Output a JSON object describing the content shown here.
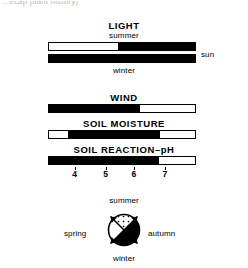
{
  "page": {
    "top_fragment": "...ecap plant history)",
    "background_color": "#ffffff",
    "ink_color": "#000000"
  },
  "light": {
    "heading": "LIGHT",
    "top_caption": "summer",
    "bottom_caption": "winter",
    "left_label": "shade",
    "right_label": "sun",
    "bars": [
      {
        "name": "summer",
        "black_start_pct": 0,
        "black_fill_pct": 0,
        "white_pct": 47,
        "segments": [
          {
            "color": "#ffffff",
            "start_pct": 0,
            "end_pct": 47
          },
          {
            "color": "#000000",
            "start_pct": 47,
            "end_pct": 100
          }
        ]
      },
      {
        "name": "winter",
        "segments": [
          {
            "color": "#000000",
            "start_pct": 0,
            "end_pct": 100
          }
        ]
      }
    ]
  },
  "wind": {
    "heading": "WIND",
    "left_label": "low",
    "right_label": "high",
    "segments": [
      {
        "color": "#000000",
        "start_pct": 0,
        "end_pct": 62
      },
      {
        "color": "#ffffff",
        "start_pct": 62,
        "end_pct": 100
      }
    ]
  },
  "soil_moisture": {
    "heading": "SOIL MOISTURE",
    "left_label": "wet",
    "right_label": "dry",
    "segments": [
      {
        "color": "#ffffff",
        "start_pct": 0,
        "end_pct": 13
      },
      {
        "color": "#000000",
        "start_pct": 13,
        "end_pct": 76
      },
      {
        "color": "#ffffff",
        "start_pct": 76,
        "end_pct": 100
      }
    ]
  },
  "soil_reaction": {
    "heading": "SOIL REACTION–pH",
    "left_label": "acidic",
    "right_label": "neutral",
    "segments": [
      {
        "color": "#000000",
        "start_pct": 0,
        "end_pct": 75
      },
      {
        "color": "#ffffff",
        "start_pct": 75,
        "end_pct": 100
      }
    ],
    "axis": {
      "ticks": [
        {
          "label": "4",
          "pos_pct": 18
        },
        {
          "label": "5",
          "pos_pct": 39
        },
        {
          "label": "6",
          "pos_pct": 58
        },
        {
          "label": "7",
          "pos_pct": 79
        }
      ]
    }
  },
  "season_circle": {
    "labels": {
      "top": "summer",
      "right": "autumn",
      "bottom": "winter",
      "left": "spring"
    },
    "quadrants": [
      {
        "name": "summer",
        "position": "top",
        "fill": "stipple"
      },
      {
        "name": "autumn",
        "position": "right",
        "fill": "#000000"
      },
      {
        "name": "winter",
        "position": "bottom",
        "fill": "#000000"
      },
      {
        "name": "spring",
        "position": "left",
        "fill": "#ffffff"
      }
    ]
  },
  "chart_data": {
    "type": "bar",
    "series": [
      {
        "name": "LIGHT (summer)",
        "left_end": "shade",
        "right_end": "sun",
        "filled_from_pct": 47,
        "filled_to_pct": 100
      },
      {
        "name": "LIGHT (winter)",
        "left_end": "shade",
        "right_end": "sun",
        "filled_from_pct": 0,
        "filled_to_pct": 100
      },
      {
        "name": "WIND",
        "left_end": "low",
        "right_end": "high",
        "filled_from_pct": 0,
        "filled_to_pct": 62
      },
      {
        "name": "SOIL MOISTURE",
        "left_end": "wet",
        "right_end": "dry",
        "filled_from_pct": 13,
        "filled_to_pct": 76
      },
      {
        "name": "SOIL REACTION–pH",
        "left_end": "acidic",
        "right_end": "neutral",
        "filled_from_pct": 0,
        "filled_to_pct": 75,
        "axis_ticks": [
          4,
          5,
          6,
          7
        ],
        "axis_range": [
          3.15,
          7.95
        ]
      }
    ],
    "grid": false,
    "legend": "none"
  }
}
